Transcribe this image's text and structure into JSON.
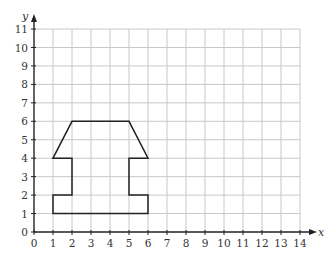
{
  "chart_data": {
    "type": "line",
    "title": "",
    "xlabel": "x",
    "ylabel": "y",
    "xlim": [
      0,
      14
    ],
    "ylim": [
      0,
      11
    ],
    "grid": true,
    "x_ticks": [
      0,
      1,
      2,
      3,
      4,
      5,
      6,
      7,
      8,
      9,
      10,
      11,
      12,
      13,
      14
    ],
    "y_ticks": [
      0,
      1,
      2,
      3,
      4,
      5,
      6,
      7,
      8,
      9,
      10,
      11
    ],
    "series": [
      {
        "name": "shape",
        "closed": true,
        "points": [
          [
            1,
            4
          ],
          [
            2,
            6
          ],
          [
            5,
            6
          ],
          [
            6,
            4
          ],
          [
            5,
            4
          ],
          [
            5,
            2
          ],
          [
            6,
            2
          ],
          [
            6,
            1
          ],
          [
            1,
            1
          ],
          [
            1,
            2
          ],
          [
            2,
            2
          ],
          [
            2,
            4
          ]
        ]
      }
    ]
  },
  "colors": {
    "grid": "#c8c8c8",
    "axis": "#222222",
    "shape": "#222222"
  }
}
